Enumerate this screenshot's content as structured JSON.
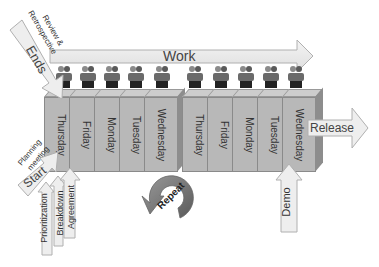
{
  "diagram": {
    "work_label": "Work",
    "ends_label": "Ends",
    "review_label_line1": "Review &",
    "review_label_line2": "Retrospective",
    "planning_label_line1": "Planning",
    "planning_label_line2": "meeting",
    "start_label": "Start",
    "release_label": "Release",
    "demo_label": "Demo",
    "repeat_label": "Repeat",
    "start_sub_arrows": [
      "Prioritization",
      "Breakdown",
      "Agreement"
    ],
    "sprint1_days": [
      "Thursday",
      "Friday",
      "Monday",
      "Tuesday",
      "Wednesday"
    ],
    "sprint2_days": [
      "Thursday",
      "Friday",
      "Monday",
      "Tuesday",
      "Wednesday"
    ],
    "team_icon_count": 10,
    "colors": {
      "arrow_fill": "#ececec",
      "arrow_stroke": "#b0b0b0",
      "box_fill": "#b8b8b8",
      "repeat_fill": "#7a7a7a"
    }
  }
}
